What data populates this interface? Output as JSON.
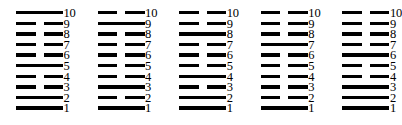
{
  "figure": {
    "name": "line-diagram-set",
    "line_color": "#000000",
    "background_color": "#ffffff",
    "row_labels": [
      "10",
      "9",
      "8",
      "7",
      "6",
      "5",
      "4",
      "3",
      "2",
      "1"
    ],
    "columns": [
      {
        "name": "column-1",
        "lines": [
          {
            "label": "10",
            "type": "solid"
          },
          {
            "label": "9",
            "type": "broken"
          },
          {
            "label": "8",
            "type": "broken"
          },
          {
            "label": "7",
            "type": "broken"
          },
          {
            "label": "6",
            "type": "broken"
          },
          {
            "label": "5",
            "type": "solid"
          },
          {
            "label": "4",
            "type": "broken"
          },
          {
            "label": "3",
            "type": "broken"
          },
          {
            "label": "2",
            "type": "solid"
          },
          {
            "label": "1",
            "type": "solid"
          }
        ]
      },
      {
        "name": "column-2",
        "lines": [
          {
            "label": "10",
            "type": "broken"
          },
          {
            "label": "9",
            "type": "solid"
          },
          {
            "label": "8",
            "type": "broken"
          },
          {
            "label": "7",
            "type": "broken"
          },
          {
            "label": "6",
            "type": "broken"
          },
          {
            "label": "5",
            "type": "broken"
          },
          {
            "label": "4",
            "type": "broken"
          },
          {
            "label": "3",
            "type": "solid"
          },
          {
            "label": "2",
            "type": "broken"
          },
          {
            "label": "1",
            "type": "solid"
          }
        ]
      },
      {
        "name": "column-3",
        "lines": [
          {
            "label": "10",
            "type": "broken"
          },
          {
            "label": "9",
            "type": "broken"
          },
          {
            "label": "8",
            "type": "solid"
          },
          {
            "label": "7",
            "type": "broken"
          },
          {
            "label": "6",
            "type": "broken"
          },
          {
            "label": "5",
            "type": "broken"
          },
          {
            "label": "4",
            "type": "solid"
          },
          {
            "label": "3",
            "type": "broken"
          },
          {
            "label": "2",
            "type": "solid"
          },
          {
            "label": "1",
            "type": "solid"
          }
        ]
      },
      {
        "name": "column-4",
        "lines": [
          {
            "label": "10",
            "type": "broken"
          },
          {
            "label": "9",
            "type": "broken"
          },
          {
            "label": "8",
            "type": "broken"
          },
          {
            "label": "7",
            "type": "solid"
          },
          {
            "label": "6",
            "type": "broken"
          },
          {
            "label": "5",
            "type": "broken"
          },
          {
            "label": "4",
            "type": "broken"
          },
          {
            "label": "3",
            "type": "broken"
          },
          {
            "label": "2",
            "type": "broken"
          },
          {
            "label": "1",
            "type": "solid"
          }
        ]
      },
      {
        "name": "column-5",
        "lines": [
          {
            "label": "10",
            "type": "broken"
          },
          {
            "label": "9",
            "type": "broken"
          },
          {
            "label": "8",
            "type": "broken"
          },
          {
            "label": "7",
            "type": "broken"
          },
          {
            "label": "6",
            "type": "solid"
          },
          {
            "label": "5",
            "type": "broken"
          },
          {
            "label": "4",
            "type": "broken"
          },
          {
            "label": "3",
            "type": "solid"
          },
          {
            "label": "2",
            "type": "solid"
          },
          {
            "label": "1",
            "type": "solid"
          }
        ]
      }
    ]
  }
}
